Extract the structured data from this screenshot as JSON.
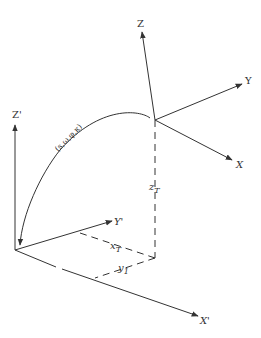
{
  "diagram": {
    "type": "coordinate-transformation",
    "labels": {
      "Z": "Z",
      "Y": "Y",
      "X": "X",
      "Z_prime": "Z'",
      "Y_prime": "Y'",
      "X_prime": "X'",
      "params": "(s,ω,φ,κ)",
      "xT": "x",
      "xT_sub": "T",
      "yT": "y",
      "yT_sub": "1",
      "zT": "z",
      "zT_sub": "T"
    },
    "colors": {
      "line": "#333333",
      "background": "#ffffff"
    }
  }
}
